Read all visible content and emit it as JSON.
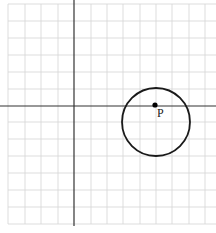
{
  "diagram": {
    "type": "coordinate-plane",
    "grid": {
      "visible": true,
      "color": "#d4d4d4",
      "vertical_lines_x": [
        8,
        25,
        41,
        58,
        91,
        107,
        123,
        140,
        156,
        172,
        189,
        205
      ],
      "horizontal_lines_y": [
        4,
        21,
        38,
        55,
        72,
        89,
        122,
        139,
        156,
        173,
        190,
        207,
        224
      ]
    },
    "axes": {
      "color": "#333333",
      "y_axis_x": 74,
      "x_axis_y": 106
    },
    "circle": {
      "cx": 156,
      "cy": 122,
      "r": 34,
      "stroke": "#1a1a1a"
    },
    "point": {
      "label": "P",
      "x": 155,
      "y": 105
    }
  }
}
